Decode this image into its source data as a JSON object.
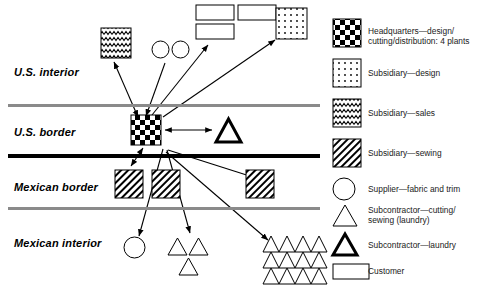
{
  "diagram": {
    "bands": [
      {
        "id": "us-interior",
        "label": "U.S. interior",
        "x": 14,
        "y": 66
      },
      {
        "id": "us-border",
        "label": "U.S. border",
        "x": 14,
        "y": 126
      },
      {
        "id": "mexican-border",
        "label": "Mexican border",
        "x": 14,
        "y": 181
      },
      {
        "id": "mexican-interior",
        "label": "Mexican interior",
        "x": 14,
        "y": 237
      }
    ],
    "dividers": [
      {
        "id": "divider-us-interior-border",
        "style": "gray",
        "y": 104,
        "width": 312
      },
      {
        "id": "divider-us-mexico",
        "style": "black",
        "y": 154,
        "width": 312
      },
      {
        "id": "divider-mexican-border-interior",
        "style": "gray",
        "y": 207,
        "width": 312
      }
    ],
    "nodes": [
      {
        "id": "sales-subsidiary",
        "type": "sales",
        "x": 101,
        "y": 28,
        "w": 30,
        "h": 30
      },
      {
        "id": "supplier-1",
        "type": "supplier",
        "x": 152,
        "y": 41,
        "w": 17,
        "h": 17
      },
      {
        "id": "supplier-2",
        "type": "supplier",
        "x": 172,
        "y": 41,
        "w": 17,
        "h": 17
      },
      {
        "id": "customer-1",
        "type": "customer",
        "x": 196,
        "y": 5,
        "w": 38,
        "h": 15
      },
      {
        "id": "customer-2",
        "type": "customer",
        "x": 238,
        "y": 5,
        "w": 38,
        "h": 15
      },
      {
        "id": "customer-3",
        "type": "customer",
        "x": 196,
        "y": 24,
        "w": 38,
        "h": 15
      },
      {
        "id": "design-subsidiary",
        "type": "design",
        "x": 276,
        "y": 8,
        "w": 31,
        "h": 31
      },
      {
        "id": "headquarters",
        "type": "headquarters",
        "x": 131,
        "y": 115,
        "w": 30,
        "h": 30
      },
      {
        "id": "laundry-subcontractor",
        "type": "laundry",
        "x": 216,
        "y": 119,
        "w": 25,
        "h": 23
      },
      {
        "id": "sewing-subsidiary-1",
        "type": "sewing",
        "x": 115,
        "y": 170,
        "w": 28,
        "h": 28
      },
      {
        "id": "sewing-subsidiary-2",
        "type": "sewing",
        "x": 152,
        "y": 170,
        "w": 28,
        "h": 28
      },
      {
        "id": "sewing-subsidiary-3",
        "type": "sewing",
        "x": 246,
        "y": 170,
        "w": 28,
        "h": 28
      },
      {
        "id": "supplier-3",
        "type": "supplier",
        "x": 124,
        "y": 237,
        "w": 21,
        "h": 21
      },
      {
        "id": "cutting-sub-1",
        "type": "cutting",
        "x": 168,
        "y": 238,
        "w": 19,
        "h": 17
      },
      {
        "id": "cutting-sub-2",
        "type": "cutting",
        "x": 189,
        "y": 238,
        "w": 19,
        "h": 17
      },
      {
        "id": "cutting-sub-3",
        "type": "cutting",
        "x": 179,
        "y": 258,
        "w": 19,
        "h": 17
      },
      {
        "id": "cutting-cluster",
        "type": "cutting-cluster",
        "x": 263,
        "y": 236,
        "w": 64,
        "h": 48,
        "rows": 3,
        "cols": 4
      }
    ],
    "arrows": [
      {
        "id": "arrow-hq-to-sales",
        "from": [
          138,
          117
        ],
        "to": [
          114,
          62
        ],
        "heads": "both"
      },
      {
        "id": "arrow-hq-to-suppliers",
        "from": [
          146,
          116
        ],
        "to": [
          165,
          63
        ],
        "heads": "start"
      },
      {
        "id": "arrow-hq-to-customers",
        "from": [
          152,
          115
        ],
        "to": [
          208,
          45
        ],
        "heads": "end"
      },
      {
        "id": "arrow-hq-to-design",
        "from": [
          163,
          117
        ],
        "to": [
          275,
          40
        ],
        "heads": "end"
      },
      {
        "id": "arrow-hq-laundry",
        "from": [
          165,
          130
        ],
        "to": [
          212,
          130
        ],
        "heads": "both"
      },
      {
        "id": "arrow-hq-sewing-1",
        "from": [
          143,
          148
        ],
        "to": [
          131,
          166
        ],
        "heads": "both"
      },
      {
        "id": "arrow-hq-sewing-3",
        "from": [
          168,
          150
        ],
        "to": [
          256,
          178
        ],
        "heads": "end"
      },
      {
        "id": "arrow-hq-supplier-3",
        "from": [
          163,
          149
        ],
        "to": [
          139,
          236
        ],
        "heads": "end"
      },
      {
        "id": "arrow-hq-cutting-small",
        "from": [
          167,
          150
        ],
        "to": [
          190,
          233
        ],
        "heads": "end"
      },
      {
        "id": "arrow-hq-cutting-cluster",
        "from": [
          166,
          152
        ],
        "to": [
          268,
          240
        ],
        "heads": "end"
      }
    ]
  },
  "legend": {
    "items": [
      {
        "id": "legend-headquarters",
        "symbol": "headquarters",
        "text": "Headquarters—design/\ncutting/distribution: 4 plants",
        "sym_y": 19,
        "sym_w": 28,
        "sym_h": 28,
        "txt_y": 26
      },
      {
        "id": "legend-subsidiary-design",
        "symbol": "design",
        "text": "Subsidiary—design",
        "sym_y": 59,
        "sym_w": 28,
        "sym_h": 28,
        "txt_y": 68
      },
      {
        "id": "legend-subsidiary-sales",
        "symbol": "sales",
        "text": "Subsidiary—sales",
        "sym_y": 99,
        "sym_w": 28,
        "sym_h": 28,
        "txt_y": 108
      },
      {
        "id": "legend-subsidiary-sewing",
        "symbol": "sewing",
        "text": "Subsidiary—sewing",
        "sym_y": 139,
        "sym_w": 28,
        "sym_h": 28,
        "txt_y": 148
      },
      {
        "id": "legend-supplier",
        "symbol": "supplier",
        "text": "Supplier—fabric and trim",
        "sym_y": 178,
        "sym_w": 22,
        "sym_h": 22,
        "txt_y": 184
      },
      {
        "id": "legend-subcontractor-cutting",
        "symbol": "cutting",
        "text": "Subcontractor—cutting/\nsewing (laundry)",
        "sym_y": 205,
        "sym_w": 24,
        "sym_h": 21,
        "txt_y": 205
      },
      {
        "id": "legend-subcontractor-laundry",
        "symbol": "laundry",
        "text": "Subcontractor—laundry",
        "sym_y": 234,
        "sym_w": 24,
        "sym_h": 21,
        "txt_y": 240
      },
      {
        "id": "legend-customer",
        "symbol": "customer",
        "text": "Customer",
        "sym_y": 264,
        "sym_w": 36,
        "sym_h": 15,
        "txt_y": 266
      }
    ]
  },
  "colors": {
    "ink": "#000000",
    "gray_divider": "#8a8a8a",
    "text": "#1a1a1a",
    "paper": "#ffffff"
  }
}
